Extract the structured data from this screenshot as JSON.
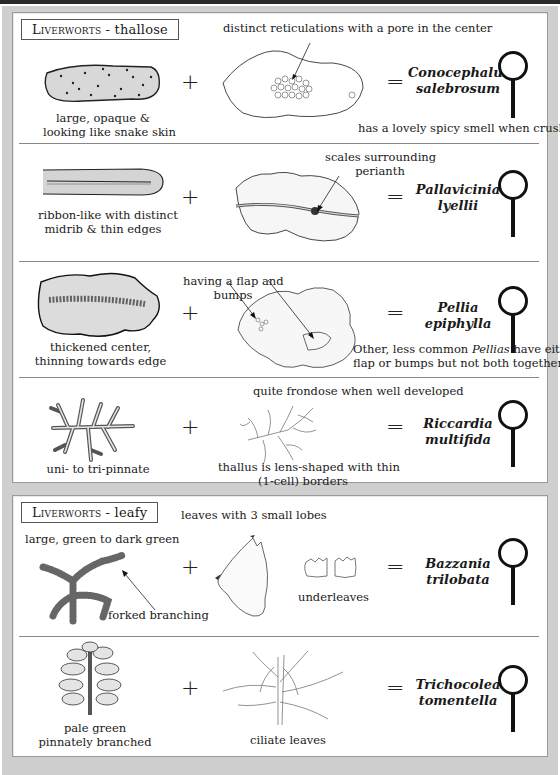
{
  "sections": [
    {
      "title_smallcaps": "Liverworts",
      "title_rest": " - thallose",
      "rows": [
        {
          "species": [
            "Conocephalum",
            "salebrosum"
          ],
          "left_caption": [
            "large, opaque &",
            "looking like snake skin"
          ],
          "top_caption": "distinct reticulations with a pore in the center",
          "bottom_note": "has a lovely spicy smell when crushed",
          "left_icon": "snake-skin-thallus-drawing",
          "middle_icon": "reticulated-thallus-drawing"
        },
        {
          "species": [
            "Pallavicinia",
            "lyellii"
          ],
          "left_caption": [
            "ribbon-like with distinct",
            "midrib & thin edges"
          ],
          "mid_caption": [
            "scales surrounding",
            "perianth"
          ],
          "left_icon": "ribbon-thallus-drawing",
          "middle_icon": "midrib-thallus-perianth-drawing"
        },
        {
          "species": [
            "Pellia",
            "epiphylla"
          ],
          "left_caption": [
            "thickened center,",
            "thinning towards edge"
          ],
          "mid_caption": [
            "having a flap and",
            "bumps"
          ],
          "bottom_note_parts": [
            "Other, less common ",
            "Pellias",
            " have either a"
          ],
          "bottom_note_line2": "flap or bumps but not both together",
          "left_icon": "thickened-thallus-drawing",
          "middle_icon": "flap-bumps-thallus-drawing"
        },
        {
          "species": [
            "Riccardia",
            "multifida"
          ],
          "left_caption": [
            "uni- to tri-pinnate"
          ],
          "top_caption": "quite frondose when well developed",
          "mid_bottom_caption": [
            "thallus is lens-shaped with thin",
            "(1-cell) borders"
          ],
          "left_icon": "pinnate-thallus-drawing",
          "middle_icon": "frondose-thallus-drawing"
        }
      ]
    },
    {
      "title_smallcaps": "Liverworts",
      "title_rest": " - leafy",
      "rows": [
        {
          "species": [
            "Bazzania",
            "trilobata"
          ],
          "left_top_caption": "large, green to dark green",
          "left_arrow_caption": "forked branching",
          "top_caption": "leaves with 3 small lobes",
          "underleaves_caption": "underleaves",
          "left_icon": "forked-branching-shoot-drawing",
          "middle_icon": "trilobed-leaf-drawing"
        },
        {
          "species": [
            "Trichocolea",
            "tomentella"
          ],
          "left_caption": [
            "pale green",
            "pinnately branched"
          ],
          "mid_caption": [
            "ciliate leaves"
          ],
          "left_icon": "pinnate-shoot-drawing",
          "middle_icon": "ciliate-leaves-drawing"
        }
      ]
    }
  ],
  "symbols": {
    "plus": "+",
    "equals": "="
  },
  "icons": {
    "lens": "magnifying-glass-icon"
  },
  "colors": {
    "frame": "#cfcfcf",
    "panel": "#ffffff",
    "ink": "#1a1a1a",
    "separator": "#888888"
  }
}
